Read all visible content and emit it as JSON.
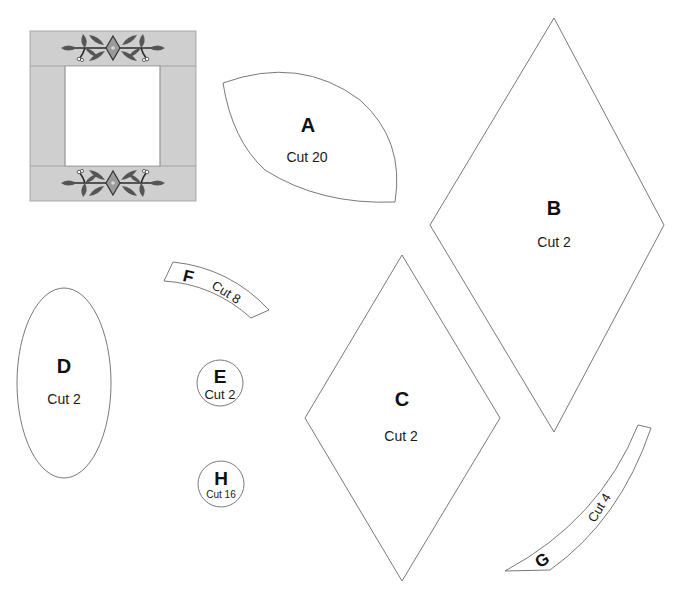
{
  "colors": {
    "frame_band": "#cfcfcf",
    "outline": "#6a6a6a",
    "leaf": "#555555",
    "text": "#111111"
  },
  "preview": {
    "name": "Block preview",
    "description": "Square frame with appliqué vine borders top and bottom"
  },
  "pieces": [
    {
      "id": "A",
      "letter": "A",
      "cut": "Cut 20",
      "shape": "leaf"
    },
    {
      "id": "B",
      "letter": "B",
      "cut": "Cut 2",
      "shape": "diamond"
    },
    {
      "id": "C",
      "letter": "C",
      "cut": "Cut 2",
      "shape": "diamond"
    },
    {
      "id": "D",
      "letter": "D",
      "cut": "Cut 2",
      "shape": "ellipse"
    },
    {
      "id": "E",
      "letter": "E",
      "cut": "Cut 2",
      "shape": "circle"
    },
    {
      "id": "F",
      "letter": "F",
      "cut": "Cut 8",
      "shape": "curved-strip"
    },
    {
      "id": "G",
      "letter": "G",
      "cut": "Cut 4",
      "shape": "curved-strip"
    },
    {
      "id": "H",
      "letter": "H",
      "cut": "Cut 16",
      "shape": "circle"
    }
  ]
}
